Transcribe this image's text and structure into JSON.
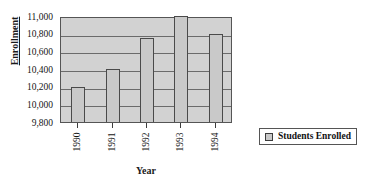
{
  "chart_data": {
    "type": "bar",
    "title": "",
    "xlabel": "Year",
    "ylabel": "Enrollment",
    "categories": [
      "1990",
      "1991",
      "1992",
      "1993",
      "1994"
    ],
    "values": [
      10200,
      10400,
      10750,
      11000,
      10800
    ],
    "series": [
      {
        "name": "Students Enrolled",
        "values": [
          10200,
          10400,
          10750,
          11000,
          10800
        ]
      }
    ],
    "ylim": [
      9800,
      11000
    ],
    "y_ticks": [
      "11,000",
      "10,800",
      "10,600",
      "10,400",
      "10,200",
      "10,000",
      "9,800"
    ],
    "y_tick_values": [
      11000,
      10800,
      10600,
      10400,
      10200,
      10000,
      9800
    ],
    "grid": true,
    "legend_position": "right",
    "legend_entries": [
      "Students Enrolled"
    ],
    "colors": {
      "bar_fill": "#c9c9c9",
      "bar_border": "#4a4a4a",
      "plot_background": "#d2d2d2",
      "gridline": "#6b6b6b",
      "frame": "#555555",
      "text": "#151515"
    }
  },
  "legend": {
    "label": "Students Enrolled"
  }
}
